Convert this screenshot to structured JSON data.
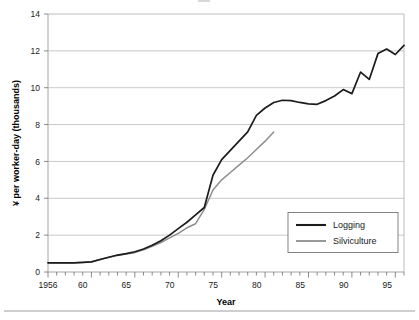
{
  "chart_data": {
    "type": "line",
    "title": "",
    "xlabel": "Year",
    "ylabel": "¥ per worker-day (thousands)",
    "xlim": [
      1956,
      1997
    ],
    "ylim": [
      0,
      14
    ],
    "yticks": [
      0,
      2,
      4,
      6,
      8,
      10,
      12,
      14
    ],
    "ytick_labels": [
      "0",
      "2",
      "4",
      "6",
      "8",
      "10",
      "12",
      "14"
    ],
    "xticks": [
      1956,
      1960,
      1965,
      1970,
      1975,
      1980,
      1985,
      1990,
      1995
    ],
    "xtick_labels": [
      "1956",
      "60",
      "65",
      "70",
      "75",
      "80",
      "85",
      "90",
      "95"
    ],
    "x_minor_tick_interval": 1,
    "grid": "horizontal",
    "legend_position": "lower-right",
    "series": [
      {
        "name": "Logging",
        "color": "#1c1c1c",
        "x": [
          1956,
          1957,
          1958,
          1959,
          1960,
          1961,
          1962,
          1963,
          1964,
          1965,
          1966,
          1967,
          1968,
          1969,
          1970,
          1971,
          1972,
          1973,
          1974,
          1975,
          1976,
          1977,
          1978,
          1979,
          1980,
          1981,
          1982,
          1983,
          1984,
          1985,
          1986,
          1987,
          1988,
          1989,
          1990,
          1991,
          1992,
          1993,
          1994,
          1995,
          1996,
          1997
        ],
        "values": [
          0.5,
          0.5,
          0.5,
          0.5,
          0.52,
          0.55,
          0.68,
          0.8,
          0.92,
          1.0,
          1.1,
          1.25,
          1.45,
          1.7,
          2.0,
          2.35,
          2.7,
          3.1,
          3.5,
          5.25,
          6.1,
          6.6,
          7.1,
          7.6,
          8.5,
          8.9,
          9.2,
          9.32,
          9.3,
          9.2,
          9.12,
          9.1,
          9.3,
          9.55,
          9.9,
          9.68,
          10.85,
          10.45,
          11.85,
          12.1,
          11.8,
          12.3
        ]
      },
      {
        "name": "Silviculture",
        "color": "#8e8e8e",
        "x": [
          1956,
          1957,
          1958,
          1959,
          1960,
          1961,
          1962,
          1963,
          1964,
          1965,
          1966,
          1967,
          1968,
          1969,
          1970,
          1971,
          1972,
          1973,
          1974,
          1975,
          1976,
          1977,
          1978,
          1979,
          1980,
          1981,
          1982
        ],
        "values": [
          0.5,
          0.5,
          0.5,
          0.5,
          0.52,
          0.55,
          0.68,
          0.8,
          0.9,
          0.98,
          1.05,
          1.2,
          1.4,
          1.6,
          1.85,
          2.1,
          2.4,
          2.62,
          3.4,
          4.45,
          5.0,
          5.4,
          5.8,
          6.2,
          6.65,
          7.1,
          7.6
        ]
      }
    ]
  },
  "axes": {
    "y_axis_title": "¥ per worker-day (thousands)",
    "x_axis_title": "Year"
  },
  "legend": {
    "items": [
      {
        "label": "Logging",
        "color": "#1c1c1c"
      },
      {
        "label": "Silviculture",
        "color": "#8e8e8e"
      }
    ]
  },
  "ytick_labels": [
    "14",
    "12",
    "10",
    "8",
    "6",
    "4",
    "2",
    "0"
  ],
  "xtick_labels": [
    "1956",
    "60",
    "65",
    "70",
    "75",
    "80",
    "85",
    "90",
    "95"
  ]
}
